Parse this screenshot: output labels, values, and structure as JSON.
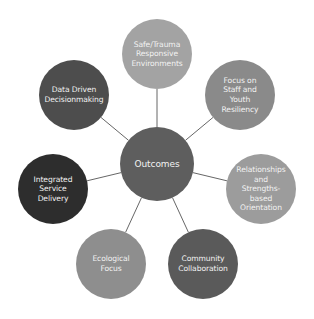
{
  "diagram": {
    "type": "hub-and-spoke",
    "center": {
      "label": "Outcomes",
      "color": "#5e5e5e",
      "cx": 157,
      "cy": 164,
      "r": 37
    },
    "nodes": [
      {
        "id": "safe-trauma",
        "label": "Safe/Trauma\nResponsive\nEnvironments",
        "color": "#a3a3a3",
        "cx": 157,
        "cy": 54,
        "r": 35
      },
      {
        "id": "staff-youth",
        "label": "Focus on\nStaff and\nYouth\nResiliency",
        "color": "#8a8a8a",
        "cx": 240,
        "cy": 95,
        "r": 35
      },
      {
        "id": "relationships",
        "label": "Relationships\nand\nStrengths-\nbased\nOrientation",
        "color": "#9c9c9c",
        "cx": 261,
        "cy": 189,
        "r": 35
      },
      {
        "id": "community",
        "label": "Community\nCollaboration",
        "color": "#5a5a5a",
        "cx": 203,
        "cy": 264,
        "r": 35
      },
      {
        "id": "ecological",
        "label": "Ecological\nFocus",
        "color": "#8e8e8e",
        "cx": 111,
        "cy": 264,
        "r": 35
      },
      {
        "id": "integrated",
        "label": "Integrated\nService\nDelivery",
        "color": "#2d2d2d",
        "cx": 53,
        "cy": 189,
        "r": 35
      },
      {
        "id": "data-driven",
        "label": "Data Driven\nDecisionmaking",
        "color": "#4d4d4d",
        "cx": 74,
        "cy": 95,
        "r": 35
      }
    ],
    "connector_color": "#555555"
  }
}
